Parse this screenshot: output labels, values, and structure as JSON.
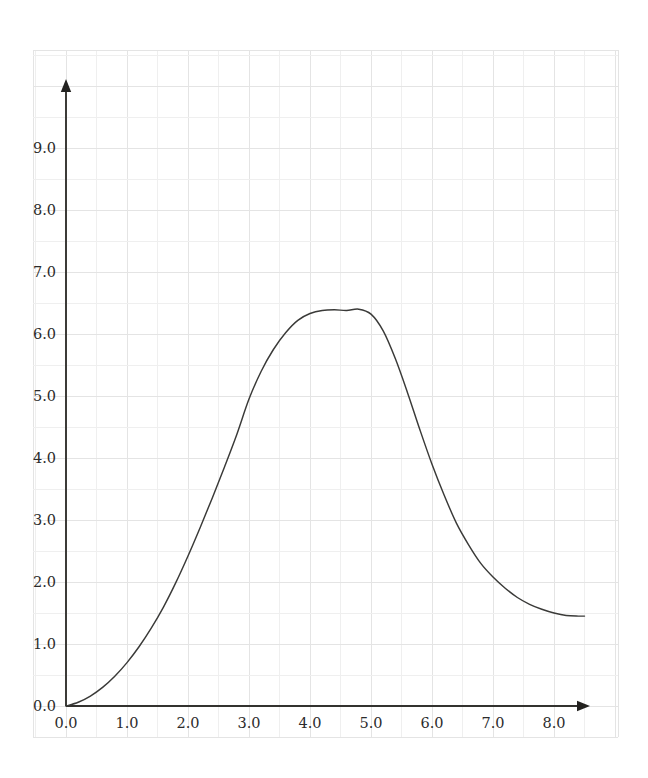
{
  "chart_data": {
    "type": "line",
    "title": "",
    "subtitle": "",
    "xlabel": "",
    "ylabel": "",
    "xlim": [
      -0.08,
      9.15
    ],
    "ylim": [
      -0.18,
      10.6
    ],
    "xticks": [
      "0.0",
      "1.0",
      "2.0",
      "3.0",
      "4.0",
      "5.0",
      "6.0",
      "7.0",
      "8.0"
    ],
    "xtick_values": [
      0,
      1,
      2,
      3,
      4,
      5,
      6,
      7,
      8
    ],
    "yticks": [
      "0.0",
      "1.0",
      "2.0",
      "3.0",
      "4.0",
      "5.0",
      "6.0",
      "7.0",
      "8.0",
      "9.0"
    ],
    "ytick_values": [
      0,
      1,
      2,
      3,
      4,
      5,
      6,
      7,
      8,
      9
    ],
    "grid": true,
    "grid_minor_step": 0.5,
    "legend": "none",
    "series": [
      {
        "name": "curve",
        "color": "#3a3a38",
        "x": [
          0.0,
          0.2,
          0.4,
          0.6,
          0.8,
          1.0,
          1.2,
          1.4,
          1.6,
          1.8,
          2.0,
          2.2,
          2.4,
          2.6,
          2.8,
          3.0,
          3.2,
          3.4,
          3.6,
          3.8,
          4.0,
          4.2,
          4.4,
          4.6,
          4.8,
          5.0,
          5.2,
          5.4,
          5.6,
          5.8,
          6.0,
          6.2,
          6.4,
          6.6,
          6.8,
          7.0,
          7.2,
          7.4,
          7.6,
          7.8,
          8.0,
          8.2,
          8.4,
          8.5
        ],
        "y": [
          0.0,
          0.06,
          0.16,
          0.3,
          0.48,
          0.7,
          0.96,
          1.26,
          1.6,
          1.99,
          2.42,
          2.88,
          3.36,
          3.86,
          4.38,
          4.95,
          5.4,
          5.75,
          6.02,
          6.22,
          6.33,
          6.38,
          6.39,
          6.38,
          6.4,
          6.32,
          6.05,
          5.6,
          5.05,
          4.46,
          3.9,
          3.4,
          2.95,
          2.6,
          2.3,
          2.08,
          1.9,
          1.75,
          1.64,
          1.56,
          1.5,
          1.46,
          1.45,
          1.45
        ]
      }
    ]
  },
  "axes": {
    "x_axis_name": "x-axis",
    "y_axis_name": "y-axis",
    "arrow_x": "right-arrow",
    "arrow_y": "up-arrow"
  }
}
